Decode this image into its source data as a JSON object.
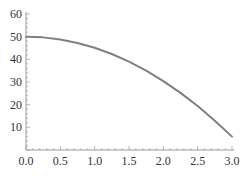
{
  "chart_data": {
    "type": "line",
    "title": "",
    "xlabel": "",
    "ylabel": "",
    "xlim": [
      0,
      3.0
    ],
    "ylim": [
      0,
      60
    ],
    "grid": false,
    "legend": null,
    "x_ticks": [
      "0.0",
      "0.5",
      "1.0",
      "1.5",
      "2.0",
      "2.5",
      "3.0"
    ],
    "y_ticks": [
      "10",
      "20",
      "30",
      "40",
      "50",
      "60"
    ],
    "series": [
      {
        "name": "curve",
        "color": "#808080",
        "x": [
          0.0,
          0.25,
          0.5,
          0.75,
          1.0,
          1.25,
          1.5,
          1.75,
          2.0,
          2.25,
          2.5,
          2.75,
          3.0
        ],
        "y": [
          50.0,
          49.69,
          48.78,
          47.24,
          45.1,
          42.34,
          38.98,
          34.99,
          30.4,
          25.19,
          19.38,
          12.94,
          5.9
        ]
      }
    ]
  }
}
